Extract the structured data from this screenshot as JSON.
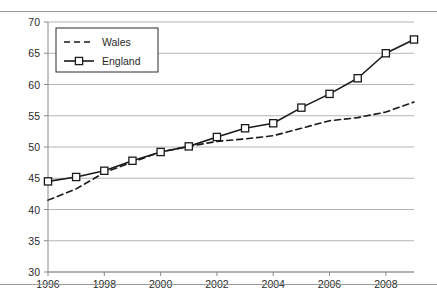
{
  "chart_data": {
    "type": "line",
    "title": "",
    "xlabel": "",
    "ylabel": "",
    "x": [
      1996,
      1997,
      1998,
      1999,
      2000,
      2001,
      2002,
      2003,
      2004,
      2005,
      2006,
      2007,
      2008,
      2009
    ],
    "xlim": [
      1996,
      2009
    ],
    "ylim": [
      30,
      70
    ],
    "x_tick_labels": [
      "1996",
      "1998",
      "2000",
      "2002",
      "2004",
      "2006",
      "2008"
    ],
    "x_ticks": [
      1996,
      1998,
      2000,
      2002,
      2004,
      2006,
      2008
    ],
    "y_tick_labels": [
      "70",
      "65",
      "60",
      "55",
      "50",
      "45",
      "40",
      "35",
      "30"
    ],
    "y_ticks": [
      70,
      65,
      60,
      55,
      50,
      45,
      40,
      35,
      30
    ],
    "grid": "horizontal",
    "legend_position": "top-left",
    "series": [
      {
        "name": "Wales",
        "style": "dashed",
        "marker": "none",
        "color": "#1a1a1a",
        "values": [
          41.5,
          43.3,
          45.9,
          47.6,
          49.2,
          50.1,
          50.9,
          51.3,
          51.8,
          53.0,
          54.2,
          54.7,
          55.6,
          57.2
        ]
      },
      {
        "name": "England",
        "style": "solid",
        "marker": "square",
        "color": "#1a1a1a",
        "values": [
          44.5,
          45.2,
          46.2,
          47.8,
          49.2,
          50.1,
          51.6,
          53.0,
          53.8,
          56.3,
          58.5,
          61.0,
          65.0,
          67.2
        ]
      }
    ]
  },
  "legend": {
    "items": [
      {
        "label": "Wales"
      },
      {
        "label": "England"
      }
    ]
  },
  "axes": {
    "y_min_label": "30",
    "y_max_label": "70"
  }
}
